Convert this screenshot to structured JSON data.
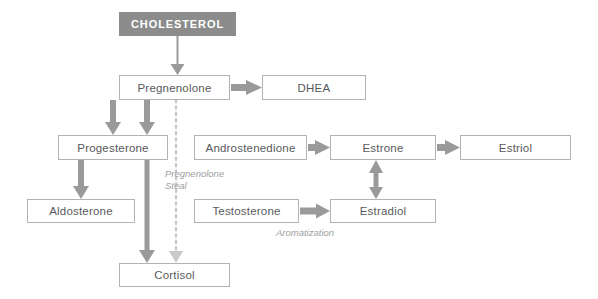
{
  "diagram": {
    "colors": {
      "header_fill": "#8c8c8c",
      "header_text": "#ffffff",
      "node_fill": "#ffffff",
      "node_border": "#b3b3b3",
      "node_text": "#58595b",
      "arrow": "#9a9a9a",
      "dotted_arrow": "#c4c4c4",
      "label_text": "#a0a0a0",
      "background": "#ffffff"
    },
    "nodes": [
      {
        "id": "cholesterol",
        "label": "CHOLESTEROL",
        "style": "header",
        "x": 119,
        "y": 12,
        "w": 117,
        "h": 24
      },
      {
        "id": "pregnenolone",
        "label": "Pregnenolone",
        "style": "plain",
        "x": 119,
        "y": 75,
        "w": 111,
        "h": 25
      },
      {
        "id": "dhea",
        "label": "DHEA",
        "style": "plain",
        "x": 262,
        "y": 75,
        "w": 104,
        "h": 25
      },
      {
        "id": "progesterone",
        "label": "Progesterone",
        "style": "plain",
        "x": 58,
        "y": 135,
        "w": 110,
        "h": 25
      },
      {
        "id": "androstenedione",
        "label": "Androstenedione",
        "style": "plain",
        "x": 194,
        "y": 135,
        "w": 113,
        "h": 25
      },
      {
        "id": "estrone",
        "label": "Estrone",
        "style": "plain",
        "x": 330,
        "y": 135,
        "w": 106,
        "h": 25
      },
      {
        "id": "estriol",
        "label": "Estriol",
        "style": "plain",
        "x": 460,
        "y": 135,
        "w": 111,
        "h": 25
      },
      {
        "id": "aldosterone",
        "label": "Aldosterone",
        "style": "plain",
        "x": 27,
        "y": 199,
        "w": 108,
        "h": 24
      },
      {
        "id": "testosterone",
        "label": "Testosterone",
        "style": "plain",
        "x": 194,
        "y": 199,
        "w": 105,
        "h": 24
      },
      {
        "id": "estradiol",
        "label": "Estradiol",
        "style": "plain",
        "x": 330,
        "y": 199,
        "w": 106,
        "h": 24
      },
      {
        "id": "cortisol",
        "label": "Cortisol",
        "style": "plain",
        "x": 119,
        "y": 263,
        "w": 111,
        "h": 24
      }
    ],
    "edge_labels": [
      {
        "id": "pregnenolone-steal",
        "text": "Pregnenolone\nSteal",
        "x": 165,
        "y": 168
      },
      {
        "id": "aromatization",
        "text": "Aromatization",
        "x": 276,
        "y": 227
      }
    ],
    "edges": [
      {
        "id": "cholesterol-to-pregnenolone",
        "from": "cholesterol",
        "to": "pregnenolone",
        "kind": "solid",
        "heads": "single"
      },
      {
        "id": "pregnenolone-to-dhea",
        "from": "pregnenolone",
        "to": "dhea",
        "kind": "solid",
        "heads": "single"
      },
      {
        "id": "pregnenolone-to-progesterone-a",
        "from": "pregnenolone",
        "to": "progesterone",
        "kind": "solid",
        "heads": "single"
      },
      {
        "id": "pregnenolone-to-progesterone-b",
        "from": "pregnenolone",
        "to": "progesterone",
        "kind": "solid",
        "heads": "single"
      },
      {
        "id": "pregnenolone-to-cortisol-dotted",
        "from": "pregnenolone",
        "to": "cortisol",
        "kind": "dotted",
        "heads": "single"
      },
      {
        "id": "progesterone-to-aldosterone",
        "from": "progesterone",
        "to": "aldosterone",
        "kind": "solid",
        "heads": "single"
      },
      {
        "id": "progesterone-to-cortisol",
        "from": "progesterone",
        "to": "cortisol",
        "kind": "solid",
        "heads": "single"
      },
      {
        "id": "androstenedione-to-estrone",
        "from": "androstenedione",
        "to": "estrone",
        "kind": "solid",
        "heads": "single"
      },
      {
        "id": "estrone-to-estriol",
        "from": "estrone",
        "to": "estriol",
        "kind": "solid",
        "heads": "single"
      },
      {
        "id": "estrone-estradiol",
        "from": "estrone",
        "to": "estradiol",
        "kind": "solid",
        "heads": "double"
      },
      {
        "id": "testosterone-to-estradiol",
        "from": "testosterone",
        "to": "estradiol",
        "kind": "solid",
        "heads": "single"
      }
    ]
  }
}
